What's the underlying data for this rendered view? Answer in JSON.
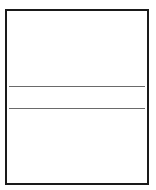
{
  "frame": {
    "border_color": "#1a1a1a",
    "background": "#ffffff"
  },
  "rules": [
    {
      "position": "upper",
      "color": "#6a6a6a"
    },
    {
      "position": "lower",
      "color": "#6a6a6a"
    }
  ]
}
